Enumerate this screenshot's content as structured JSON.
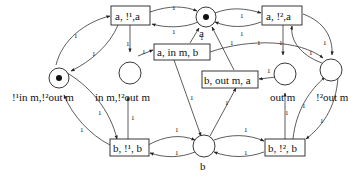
{
  "places": {
    "top": {
      "label": "a",
      "token": true
    },
    "left": {
      "label": "!¹in m,!²out m",
      "token": true
    },
    "mid_left": {
      "label": "in m,!²out m",
      "token": false
    },
    "mid_right": {
      "label": "out m",
      "token": false
    },
    "right": {
      "label": "!²out m",
      "token": false
    },
    "bottom": {
      "label": "b",
      "token": false
    }
  },
  "transitions": {
    "t_a1": {
      "label": "a, !¹,a"
    },
    "t_a2": {
      "label": "a, !²,a"
    },
    "t_ainb": {
      "label": "a, in m, b"
    },
    "t_bouta": {
      "label": "b, out m, a"
    },
    "t_b1": {
      "label": "b, !¹, b"
    },
    "t_b2": {
      "label": "b, !², b"
    }
  },
  "arc_weight": "1"
}
